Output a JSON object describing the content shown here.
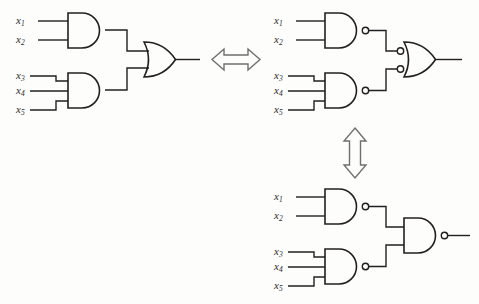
{
  "figure": {
    "background_color": "#fdfdfc",
    "ink_color": "#231f20",
    "line_width": 1.5,
    "bubble_radius": 3.2
  },
  "input_labels": {
    "x1": "x",
    "x2": "x",
    "x3": "x",
    "x4": "x",
    "x5": "x",
    "sub1": "1",
    "sub2": "2",
    "sub3": "3",
    "sub4": "4",
    "sub5": "5"
  },
  "circuits": [
    {
      "id": "circuit-and-or",
      "name": "and-or-circuit",
      "position": "left",
      "gates": [
        {
          "id": "g1",
          "type": "AND",
          "inputs": 2,
          "input_bubbles": false,
          "output_bubble": false,
          "input_labels": [
            "x1",
            "x2"
          ]
        },
        {
          "id": "g2",
          "type": "AND",
          "inputs": 3,
          "input_bubbles": false,
          "output_bubble": false,
          "input_labels": [
            "x3",
            "x4",
            "x5"
          ]
        },
        {
          "id": "g3",
          "type": "OR",
          "inputs": 2,
          "input_bubbles": false,
          "output_bubble": false,
          "input_labels": []
        }
      ]
    },
    {
      "id": "circuit-nand-or",
      "name": "nand-into-or-circuit",
      "position": "top-right",
      "gates": [
        {
          "id": "g4",
          "type": "NAND",
          "inputs": 2,
          "input_bubbles": false,
          "output_bubble": true,
          "input_labels": [
            "x1",
            "x2"
          ]
        },
        {
          "id": "g5",
          "type": "NAND",
          "inputs": 3,
          "input_bubbles": false,
          "output_bubble": true,
          "input_labels": [
            "x3",
            "x4",
            "x5"
          ]
        },
        {
          "id": "g6",
          "type": "OR",
          "inputs": 2,
          "input_bubbles": true,
          "output_bubble": false,
          "input_labels": []
        }
      ]
    },
    {
      "id": "circuit-all-nand",
      "name": "all-nand-circuit",
      "position": "bottom-right",
      "gates": [
        {
          "id": "g7",
          "type": "NAND",
          "inputs": 2,
          "input_bubbles": false,
          "output_bubble": true,
          "input_labels": [
            "x1",
            "x2"
          ]
        },
        {
          "id": "g8",
          "type": "NAND",
          "inputs": 3,
          "input_bubbles": false,
          "output_bubble": true,
          "input_labels": [
            "x3",
            "x4",
            "x5"
          ]
        },
        {
          "id": "g9",
          "type": "NAND",
          "inputs": 2,
          "input_bubbles": false,
          "output_bubble": true,
          "input_labels": []
        }
      ]
    }
  ],
  "equivalence_arrows": [
    {
      "id": "arrow-h",
      "name": "horizontal-equivalence-arrow",
      "orientation": "horizontal",
      "heads": "double"
    },
    {
      "id": "arrow-v",
      "name": "vertical-equivalence-arrow",
      "orientation": "vertical",
      "heads": "double"
    }
  ]
}
